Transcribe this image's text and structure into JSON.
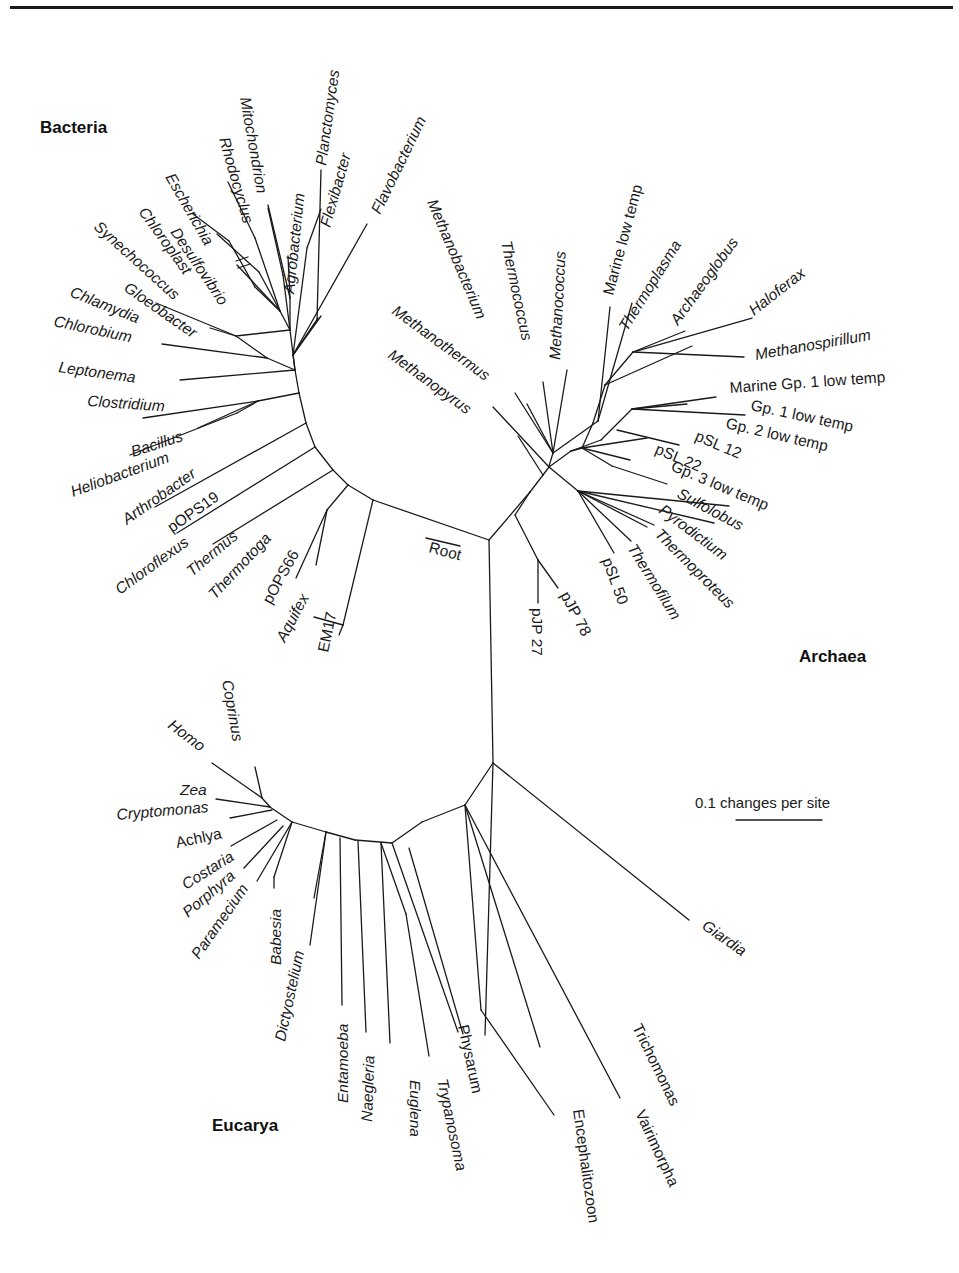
{
  "figure": {
    "type": "unrooted phylogenetic tree (rRNA)",
    "domains": [
      {
        "name": "Bacteria",
        "x": 40,
        "y": 133
      },
      {
        "name": "Archaea",
        "x": 799,
        "y": 662
      },
      {
        "name": "Eucarya",
        "x": 212,
        "y": 1131
      }
    ],
    "root_label": {
      "text": "Root",
      "x": 428,
      "y": 552,
      "angle": 15,
      "bar": [
        426,
        538,
        460,
        546
      ]
    },
    "scale_bar": {
      "label": "0.1 changes per site",
      "x": 695,
      "y": 808,
      "bar": [
        736,
        820,
        822,
        820
      ]
    },
    "colors": {
      "ink": "#1a1a1a",
      "background": "#ffffff"
    }
  },
  "branches": [
    [
      489,
      540,
      493,
      763
    ],
    [
      489,
      540,
      530,
      492
    ],
    [
      489,
      540,
      373,
      500
    ],
    [
      373,
      500,
      348,
      485
    ],
    [
      348,
      485,
      333,
      470
    ],
    [
      333,
      470,
      315,
      447
    ],
    [
      315,
      447,
      306,
      423
    ],
    [
      306,
      423,
      299,
      393
    ],
    [
      299,
      393,
      295,
      370
    ],
    [
      373,
      500,
      343,
      625
    ],
    [
      343,
      625,
      314,
      617
    ],
    [
      343,
      625,
      339,
      635
    ],
    [
      348,
      485,
      327,
      510
    ],
    [
      327,
      510,
      296,
      578
    ],
    [
      327,
      510,
      316,
      565
    ],
    [
      333,
      470,
      213,
      544
    ],
    [
      315,
      447,
      177,
      533
    ],
    [
      306,
      423,
      155,
      507
    ],
    [
      299,
      393,
      258,
      401
    ],
    [
      258,
      401,
      198,
      428
    ],
    [
      258,
      401,
      237,
      413
    ],
    [
      258,
      401,
      143,
      418
    ],
    [
      237,
      413,
      130,
      455
    ],
    [
      295,
      370,
      267,
      358
    ],
    [
      295,
      370,
      180,
      380
    ],
    [
      267,
      358,
      162,
      344
    ],
    [
      267,
      358,
      236,
      336
    ],
    [
      236,
      336,
      156,
      303
    ],
    [
      236,
      336,
      210,
      328
    ],
    [
      295,
      370,
      290,
      330
    ],
    [
      290,
      330,
      236,
      336
    ],
    [
      290,
      330,
      280,
      311
    ],
    [
      280,
      311,
      255,
      287
    ],
    [
      255,
      287,
      229,
      241
    ],
    [
      229,
      241,
      193,
      214
    ],
    [
      280,
      311,
      259,
      272
    ],
    [
      259,
      272,
      217,
      234
    ],
    [
      280,
      311,
      237,
      265
    ],
    [
      280,
      311,
      255,
      238
    ],
    [
      255,
      238,
      228,
      182
    ],
    [
      290,
      330,
      283,
      275
    ],
    [
      283,
      275,
      268,
      208
    ],
    [
      290,
      330,
      290,
      298
    ],
    [
      290,
      298,
      268,
      205
    ],
    [
      290,
      298,
      288,
      256
    ],
    [
      295,
      370,
      293,
      355
    ],
    [
      293,
      355,
      317,
      320
    ],
    [
      317,
      320,
      321,
      170
    ],
    [
      293,
      355,
      318,
      318
    ],
    [
      293,
      355,
      307,
      248
    ],
    [
      307,
      248,
      321,
      209
    ],
    [
      293,
      355,
      367,
      224
    ],
    [
      293,
      355,
      321,
      316
    ],
    [
      530,
      492,
      543,
      475
    ],
    [
      543,
      475,
      549,
      467
    ],
    [
      549,
      467,
      571,
      451
    ],
    [
      571,
      451,
      582,
      448
    ],
    [
      582,
      448,
      593,
      423
    ],
    [
      593,
      423,
      605,
      385
    ],
    [
      605,
      385,
      633,
      352
    ],
    [
      633,
      352,
      685,
      331
    ],
    [
      549,
      467,
      493,
      407
    ],
    [
      543,
      475,
      518,
      436
    ],
    [
      549,
      466,
      553,
      453
    ],
    [
      553,
      453,
      515,
      393
    ],
    [
      553,
      453,
      527,
      404
    ],
    [
      553,
      453,
      543,
      382
    ],
    [
      553,
      453,
      567,
      370
    ],
    [
      553,
      453,
      598,
      421
    ],
    [
      598,
      421,
      610,
      307
    ],
    [
      598,
      421,
      632,
      303
    ],
    [
      605,
      385,
      692,
      346
    ],
    [
      633,
      352,
      752,
      318
    ],
    [
      633,
      352,
      744,
      357
    ],
    [
      571,
      451,
      601,
      440
    ],
    [
      601,
      440,
      632,
      409
    ],
    [
      632,
      409,
      716,
      397
    ],
    [
      632,
      409,
      745,
      415
    ],
    [
      632,
      409,
      687,
      404
    ],
    [
      617,
      430,
      679,
      445
    ],
    [
      582,
      448,
      647,
      438
    ],
    [
      582,
      448,
      630,
      460
    ],
    [
      582,
      448,
      612,
      466
    ],
    [
      612,
      466,
      667,
      484
    ],
    [
      549,
      467,
      578,
      491
    ],
    [
      578,
      491,
      729,
      506
    ],
    [
      578,
      491,
      714,
      523
    ],
    [
      578,
      491,
      647,
      527
    ],
    [
      578,
      491,
      614,
      553
    ],
    [
      578,
      491,
      631,
      541
    ],
    [
      578,
      491,
      654,
      525
    ],
    [
      530,
      492,
      515,
      515
    ],
    [
      515,
      515,
      538,
      560
    ],
    [
      538,
      560,
      558,
      588
    ],
    [
      538,
      560,
      538,
      603
    ],
    [
      493,
      763,
      465,
      805
    ],
    [
      465,
      805,
      422,
      822
    ],
    [
      422,
      822,
      392,
      843
    ],
    [
      392,
      843,
      355,
      840
    ],
    [
      355,
      840,
      326,
      832
    ],
    [
      326,
      832,
      292,
      822
    ],
    [
      292,
      822,
      270,
      807
    ],
    [
      270,
      807,
      262,
      798
    ],
    [
      262,
      798,
      255,
      767
    ],
    [
      262,
      798,
      212,
      763
    ],
    [
      270,
      807,
      216,
      799
    ],
    [
      272,
      810,
      230,
      818
    ],
    [
      277,
      820,
      231,
      846
    ],
    [
      283,
      826,
      244,
      868
    ],
    [
      292,
      822,
      257,
      881
    ],
    [
      292,
      822,
      274,
      877
    ],
    [
      274,
      877,
      274,
      888
    ],
    [
      326,
      832,
      314,
      898
    ],
    [
      326,
      832,
      310,
      945
    ],
    [
      340,
      838,
      342,
      1005
    ],
    [
      358,
      841,
      366,
      1032
    ],
    [
      381,
      843,
      390,
      1043
    ],
    [
      381,
      843,
      406,
      914
    ],
    [
      406,
      914,
      429,
      1056
    ],
    [
      392,
      843,
      458,
      1032
    ],
    [
      409,
      848,
      463,
      1034
    ],
    [
      465,
      805,
      540,
      1047
    ],
    [
      465,
      805,
      481,
      1010
    ],
    [
      481,
      1010,
      554,
      1115
    ],
    [
      465,
      805,
      620,
      1098
    ],
    [
      493,
      763,
      689,
      920
    ],
    [
      493,
      763,
      485,
      1035
    ]
  ],
  "taxa": [
    {
      "name": "Mitochondrion",
      "x": 240,
      "y": 98,
      "angle": 80,
      "style": "italic"
    },
    {
      "name": "Rhodocyclus",
      "x": 219,
      "y": 139,
      "angle": 74,
      "style": "italic"
    },
    {
      "name": "Escherichia",
      "x": 165,
      "y": 177,
      "angle": 60,
      "style": "italic"
    },
    {
      "name": "Desulfovibrio",
      "x": 170,
      "y": 232,
      "angle": 56,
      "style": "italic"
    },
    {
      "name": "Chloroplast",
      "x": 138,
      "y": 212,
      "angle": 54,
      "style": "italic"
    },
    {
      "name": "Synechococcus",
      "x": 93,
      "y": 228,
      "angle": 42,
      "style": "italic"
    },
    {
      "name": "Gloeobacter",
      "x": 123,
      "y": 290,
      "angle": 35,
      "style": "italic"
    },
    {
      "name": "Chlamydia",
      "x": 69,
      "y": 296,
      "angle": 22,
      "style": "italic"
    },
    {
      "name": "Chlorobium",
      "x": 53,
      "y": 326,
      "angle": 12,
      "style": "italic"
    },
    {
      "name": "Leptonema",
      "x": 58,
      "y": 372,
      "angle": 8,
      "style": "italic"
    },
    {
      "name": "Clostridium",
      "x": 87,
      "y": 406,
      "angle": 4,
      "style": "italic"
    },
    {
      "name": "Bacillus",
      "x": 133,
      "y": 457,
      "angle": -18,
      "style": "italic"
    },
    {
      "name": "Heliobacterium",
      "x": 73,
      "y": 497,
      "angle": -20,
      "style": "italic"
    },
    {
      "name": "Arthrobacter",
      "x": 127,
      "y": 525,
      "angle": -35,
      "style": "italic"
    },
    {
      "name": "pOPS19",
      "x": 172,
      "y": 533,
      "angle": -35,
      "style": "upright"
    },
    {
      "name": "Chloroflexus",
      "x": 120,
      "y": 595,
      "angle": -36,
      "style": "italic"
    },
    {
      "name": "Thermus",
      "x": 192,
      "y": 577,
      "angle": -40,
      "style": "italic"
    },
    {
      "name": "Thermotoga",
      "x": 215,
      "y": 600,
      "angle": -47,
      "style": "italic"
    },
    {
      "name": "pOPS66",
      "x": 271,
      "y": 605,
      "angle": -61,
      "style": "upright"
    },
    {
      "name": "Aquifex",
      "x": 285,
      "y": 643,
      "angle": -62,
      "style": "italic"
    },
    {
      "name": "EM17",
      "x": 328,
      "y": 653,
      "angle": -78,
      "style": "upright"
    },
    {
      "name": "Agrobacterium",
      "x": 294,
      "y": 294,
      "angle": -84,
      "style": "italic"
    },
    {
      "name": "Planctomyces",
      "x": 326,
      "y": 166,
      "angle": -82,
      "style": "italic"
    },
    {
      "name": "Flexibacter",
      "x": 330,
      "y": 228,
      "angle": -74,
      "style": "italic"
    },
    {
      "name": "Flavobacterium",
      "x": 380,
      "y": 215,
      "angle": -64,
      "style": "italic"
    },
    {
      "name": "Methanobacterium",
      "x": 427,
      "y": 202,
      "angle": 67,
      "style": "italic"
    },
    {
      "name": "Thermococcus",
      "x": 501,
      "y": 242,
      "angle": 78,
      "style": "italic"
    },
    {
      "name": "Methanococcus",
      "x": 560,
      "y": 360,
      "angle": -87,
      "style": "italic"
    },
    {
      "name": "Methanothermus",
      "x": 391,
      "y": 313,
      "angle": 36,
      "style": "italic"
    },
    {
      "name": "Methanopyrus",
      "x": 387,
      "y": 357,
      "angle": 36,
      "style": "italic"
    },
    {
      "name": "Marine low temp",
      "x": 613,
      "y": 296,
      "angle": -75,
      "style": "upright"
    },
    {
      "name": "Thermoplasma",
      "x": 627,
      "y": 332,
      "angle": -58,
      "style": "italic"
    },
    {
      "name": "Archaeoglobus",
      "x": 678,
      "y": 326,
      "angle": -54,
      "style": "italic"
    },
    {
      "name": "Haloferax",
      "x": 754,
      "y": 316,
      "angle": -38,
      "style": "italic"
    },
    {
      "name": "Methanospirillum",
      "x": 756,
      "y": 360,
      "angle": -10,
      "style": "italic"
    },
    {
      "name": "Marine Gp. 1 low temp",
      "x": 730,
      "y": 393,
      "angle": -4,
      "style": "upright"
    },
    {
      "name": "Gp. 1 low temp",
      "x": 750,
      "y": 410,
      "angle": 12,
      "style": "upright"
    },
    {
      "name": "Gp. 2 low temp",
      "x": 725,
      "y": 428,
      "angle": 13,
      "style": "upright"
    },
    {
      "name": "pSL 12",
      "x": 694,
      "y": 440,
      "angle": 23,
      "style": "upright"
    },
    {
      "name": "pSL 22",
      "x": 654,
      "y": 453,
      "angle": 23,
      "style": "upright"
    },
    {
      "name": "Gp. 3 low temp",
      "x": 670,
      "y": 470,
      "angle": 23,
      "style": "upright"
    },
    {
      "name": "Sulfolobus",
      "x": 676,
      "y": 497,
      "angle": 28,
      "style": "italic"
    },
    {
      "name": "Pyrodictium",
      "x": 658,
      "y": 512,
      "angle": 37,
      "style": "italic"
    },
    {
      "name": "Thermoproteus",
      "x": 654,
      "y": 535,
      "angle": 45,
      "style": "italic"
    },
    {
      "name": "Thermofilum",
      "x": 627,
      "y": 548,
      "angle": 58,
      "style": "italic"
    },
    {
      "name": "pSL 50",
      "x": 602,
      "y": 560,
      "angle": 70,
      "style": "upright"
    },
    {
      "name": "pJP 78",
      "x": 560,
      "y": 595,
      "angle": 62,
      "style": "upright"
    },
    {
      "name": "pJP 27",
      "x": 532,
      "y": 608,
      "angle": 90,
      "style": "upright"
    },
    {
      "name": "Coprinus",
      "x": 222,
      "y": 681,
      "angle": 80,
      "style": "italic"
    },
    {
      "name": "Homo",
      "x": 167,
      "y": 727,
      "angle": 37,
      "style": "italic"
    },
    {
      "name": "Zea",
      "x": 180,
      "y": 795,
      "angle": 0,
      "style": "italic"
    },
    {
      "name": "Cryptomonas",
      "x": 117,
      "y": 820,
      "angle": -5,
      "style": "italic"
    },
    {
      "name": "Achlya",
      "x": 177,
      "y": 848,
      "angle": -12,
      "style": "upright"
    },
    {
      "name": "Costaria",
      "x": 186,
      "y": 890,
      "angle": -32,
      "style": "italic"
    },
    {
      "name": "Porphyra",
      "x": 188,
      "y": 918,
      "angle": -40,
      "style": "italic"
    },
    {
      "name": "Paramecium",
      "x": 199,
      "y": 960,
      "angle": -55,
      "style": "italic"
    },
    {
      "name": "Babesia",
      "x": 281,
      "y": 965,
      "angle": -90,
      "style": "italic"
    },
    {
      "name": "Dictyostelium",
      "x": 285,
      "y": 1042,
      "angle": -78,
      "style": "italic"
    },
    {
      "name": "Entamoeba",
      "x": 348,
      "y": 1103,
      "angle": -90,
      "style": "italic"
    },
    {
      "name": "Naegleria",
      "x": 372,
      "y": 1122,
      "angle": -88,
      "style": "italic"
    },
    {
      "name": "Euglena",
      "x": 410,
      "y": 1080,
      "angle": 90,
      "style": "italic"
    },
    {
      "name": "Trypanosoma",
      "x": 437,
      "y": 1080,
      "angle": 78,
      "style": "italic"
    },
    {
      "name": "Physarum",
      "x": 458,
      "y": 1026,
      "angle": 78,
      "style": "upright"
    },
    {
      "name": "Encephalitozoon",
      "x": 573,
      "y": 1110,
      "angle": 82,
      "style": "upright"
    },
    {
      "name": "Vairimorpha",
      "x": 635,
      "y": 1113,
      "angle": 65,
      "style": "upright"
    },
    {
      "name": "Trichomonas",
      "x": 632,
      "y": 1027,
      "angle": 64,
      "style": "upright"
    },
    {
      "name": "Giardia",
      "x": 701,
      "y": 928,
      "angle": 35,
      "style": "italic"
    }
  ],
  "mitochondrion_break": [
    [
      236,
      261,
      248,
      257
    ],
    [
      238,
      268,
      250,
      264
    ]
  ]
}
